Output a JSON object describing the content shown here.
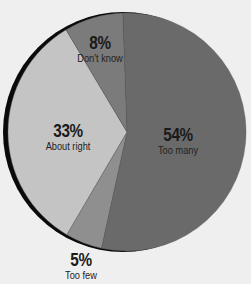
{
  "chart_data": {
    "type": "pie",
    "title": "",
    "start_angle_deg": -2,
    "direction": "clockwise",
    "slices": [
      {
        "label": "Too many",
        "value": 54,
        "display": "54%",
        "color": "#6a6a6a",
        "label_pos": {
          "x": 178,
          "y": 126
        }
      },
      {
        "label": "Too few",
        "value": 5,
        "display": "5%",
        "color": "#8f8f8f",
        "label_pos": {
          "x": 81,
          "y": 251
        }
      },
      {
        "label": "About right",
        "value": 33,
        "display": "33%",
        "color": "#c4c4c4",
        "label_pos": {
          "x": 68,
          "y": 122
        }
      },
      {
        "label": "Don't know",
        "value": 8,
        "display": "8%",
        "color": "#7b7b7b",
        "label_pos": {
          "x": 100,
          "y": 34
        }
      }
    ],
    "shadow_color": "#0a0a0a",
    "background": "#efefef",
    "legend": "none"
  }
}
